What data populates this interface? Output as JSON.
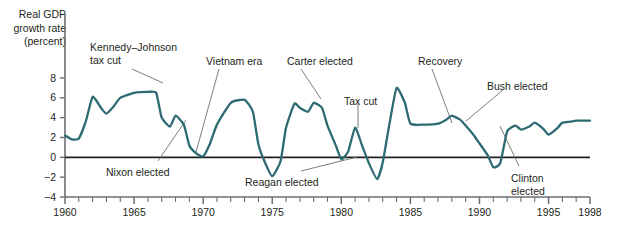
{
  "axis_label": {
    "line1": "Real GDP",
    "line2": "growth rate",
    "line3": "(percent)"
  },
  "annotations": [
    {
      "key": "kennedy-johnson-tax-cut",
      "line1": "Kennedy–Johnson",
      "line2": "tax cut",
      "x": 90,
      "y": 41
    },
    {
      "key": "vietnam-era",
      "line1": "Vietnam era",
      "line2": "",
      "x": 206,
      "y": 55
    },
    {
      "key": "carter-elected",
      "line1": "Carter elected",
      "line2": "",
      "x": 287,
      "y": 55
    },
    {
      "key": "tax-cut",
      "line1": "Tax cut",
      "line2": "",
      "x": 344,
      "y": 95
    },
    {
      "key": "recovery",
      "line1": "Recovery",
      "line2": "",
      "x": 418,
      "y": 55
    },
    {
      "key": "bush-elected",
      "line1": "Bush elected",
      "line2": "",
      "x": 487,
      "y": 80
    },
    {
      "key": "nixon-elected",
      "line1": "Nixon elected",
      "line2": "",
      "x": 106,
      "y": 166
    },
    {
      "key": "reagan-elected",
      "line1": "Reagan elected",
      "line2": "",
      "x": 245,
      "y": 176
    },
    {
      "key": "clinton-elected",
      "line1": "Clinton",
      "line2": "elected",
      "x": 511,
      "y": 172
    }
  ],
  "colors": {
    "line": "#2d6b72",
    "axis": "#6d6e71",
    "zero_line": "#231f20",
    "leader": "#6d6e71",
    "background": "#ffffff"
  },
  "chart_data": {
    "type": "line",
    "title": "",
    "xlabel": "",
    "ylabel": "Real GDP growth rate (percent)",
    "xlim": [
      1960,
      1998
    ],
    "ylim": [
      -4,
      9
    ],
    "yticks": [
      -4,
      -2,
      0,
      2,
      4,
      6,
      8
    ],
    "ytick_labels": [
      "−4",
      "−2",
      "0",
      "2",
      "4",
      "6",
      "8"
    ],
    "xticks": [
      1960,
      1965,
      1970,
      1975,
      1980,
      1985,
      1990,
      1995,
      1998
    ],
    "xtick_labels": [
      "1960",
      "1965",
      "1970",
      "1975",
      "1980",
      "1985",
      "1990",
      "1995",
      "1998"
    ],
    "minor_xtick_interval": 1,
    "grid": false,
    "legend": "none",
    "zero_reference_line": 0,
    "series": [
      {
        "name": "Real GDP growth rate",
        "x": [
          1960,
          1960.5,
          1961,
          1961.5,
          1962,
          1962.6,
          1963,
          1963.5,
          1964,
          1965,
          1966,
          1966.6,
          1967,
          1967.6,
          1968,
          1968.6,
          1969,
          1969.5,
          1970,
          1970.5,
          1971,
          1972,
          1973,
          1973.6,
          1974,
          1974.5,
          1975,
          1975.6,
          1976,
          1976.6,
          1977,
          1977.6,
          1978,
          1978.6,
          1979,
          1979.6,
          1980,
          1980.5,
          1981,
          1981.5,
          1982,
          1982.6,
          1983,
          1983.5,
          1984,
          1984.6,
          1985,
          1986,
          1987,
          1987.6,
          1988,
          1988.6,
          1989,
          1989.6,
          1990,
          1990.6,
          1991,
          1991.5,
          1992,
          1992.6,
          1993,
          1993.6,
          1994,
          1994.6,
          1995,
          1995.6,
          1996,
          1996.6,
          1997,
          1998
        ],
        "y": [
          2.2,
          1.8,
          1.9,
          3.6,
          6.1,
          5.0,
          4.4,
          5.1,
          6.0,
          6.5,
          6.6,
          6.5,
          4.0,
          3.1,
          4.2,
          3.3,
          1.2,
          0.4,
          0.1,
          1.4,
          3.3,
          5.5,
          5.8,
          4.6,
          1.3,
          -0.6,
          -1.9,
          -0.4,
          3.0,
          5.4,
          5.0,
          4.6,
          5.5,
          5.0,
          3.2,
          1.2,
          -0.2,
          0.6,
          3.0,
          1.2,
          -0.6,
          -2.2,
          -0.5,
          3.5,
          7.0,
          5.5,
          3.4,
          3.3,
          3.4,
          3.8,
          4.2,
          3.8,
          3.2,
          2.2,
          1.4,
          0.2,
          -1.0,
          -0.6,
          2.6,
          3.2,
          2.8,
          3.1,
          3.5,
          2.9,
          2.3,
          2.9,
          3.5,
          3.6,
          3.7,
          3.7
        ]
      }
    ],
    "leader_lines": [
      {
        "from_label": "kennedy-johnson-tax-cut",
        "x1": 132,
        "y1": 69,
        "x2": 163,
        "y2": 83
      },
      {
        "from_label": "vietnam-era",
        "x1": 219,
        "y1": 69,
        "x2": 196,
        "y2": 152
      },
      {
        "from_label": "carter-elected",
        "x1": 301,
        "y1": 69,
        "x2": 321,
        "y2": 99
      },
      {
        "from_label": "tax-cut",
        "x1": 358,
        "y1": 103,
        "x2": 358,
        "y2": 128
      },
      {
        "from_label": "recovery",
        "x1": 432,
        "y1": 69,
        "x2": 452,
        "y2": 123
      },
      {
        "from_label": "bush-elected",
        "x1": 503,
        "y1": 90,
        "x2": 466,
        "y2": 121
      },
      {
        "from_label": "nixon-elected",
        "x1": 158,
        "y1": 161,
        "x2": 186,
        "y2": 120
      },
      {
        "from_label": "reagan-elected",
        "x1": 301,
        "y1": 171,
        "x2": 357,
        "y2": 157
      },
      {
        "from_label": "clinton-elected",
        "x1": 519,
        "y1": 166,
        "x2": 500,
        "y2": 126
      }
    ]
  }
}
